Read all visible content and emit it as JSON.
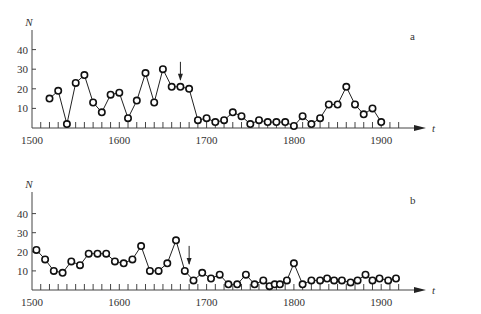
{
  "chart_data": [
    {
      "type": "line",
      "panel_label": "a",
      "title": "",
      "xlabel": "t",
      "ylabel": "N",
      "xlim": [
        1500,
        1960
      ],
      "ylim": [
        0,
        48
      ],
      "x_ticks": [
        1500,
        1600,
        1700,
        1800,
        1900
      ],
      "y_ticks": [
        10,
        20,
        30,
        40
      ],
      "grid": false,
      "annotation": {
        "type": "arrow",
        "x": 1670,
        "label": ""
      },
      "series": [
        {
          "name": "N",
          "x": [
            1520,
            1530,
            1540,
            1550,
            1560,
            1570,
            1580,
            1590,
            1600,
            1610,
            1620,
            1630,
            1640,
            1650,
            1660,
            1670,
            1680,
            1690,
            1700,
            1710,
            1720,
            1730,
            1740,
            1750,
            1760,
            1770,
            1780,
            1790,
            1800,
            1810,
            1820,
            1830,
            1840,
            1850,
            1860,
            1870,
            1880,
            1890,
            1900
          ],
          "values": [
            15,
            19,
            2,
            23,
            27,
            13,
            8,
            17,
            18,
            5,
            14,
            28,
            13,
            30,
            21,
            21,
            20,
            4,
            5,
            3,
            4,
            8,
            6,
            2,
            4,
            3,
            3,
            3,
            1,
            6,
            2,
            5,
            12,
            12,
            21,
            12,
            7,
            10,
            3
          ]
        }
      ]
    },
    {
      "type": "line",
      "panel_label": "b",
      "title": "",
      "xlabel": "t",
      "ylabel": "N",
      "xlim": [
        1500,
        1960
      ],
      "ylim": [
        0,
        48
      ],
      "x_ticks": [
        1500,
        1600,
        1700,
        1800,
        1900
      ],
      "y_ticks": [
        10,
        20,
        30,
        40
      ],
      "grid": false,
      "annotation": {
        "type": "arrow",
        "x": 1680,
        "label": ""
      },
      "series": [
        {
          "name": "N",
          "x": [
            1505,
            1515,
            1525,
            1535,
            1545,
            1555,
            1565,
            1575,
            1585,
            1595,
            1605,
            1615,
            1625,
            1635,
            1645,
            1655,
            1665,
            1675,
            1685,
            1695,
            1705,
            1715,
            1725,
            1735,
            1745,
            1755,
            1765,
            1772,
            1778,
            1784,
            1792,
            1800,
            1810,
            1820,
            1830,
            1838,
            1846,
            1855,
            1865,
            1873,
            1882,
            1890,
            1898,
            1908,
            1917
          ],
          "values": [
            21,
            16,
            10,
            9,
            15,
            13,
            19,
            19,
            19,
            15,
            14,
            16,
            23,
            10,
            10,
            14,
            26,
            10,
            5,
            9,
            6,
            8,
            3,
            3,
            8,
            3,
            5,
            2,
            3,
            3,
            5,
            14,
            3,
            5,
            5,
            6,
            5,
            5,
            4,
            5,
            8,
            5,
            6,
            5,
            6
          ]
        }
      ]
    }
  ]
}
